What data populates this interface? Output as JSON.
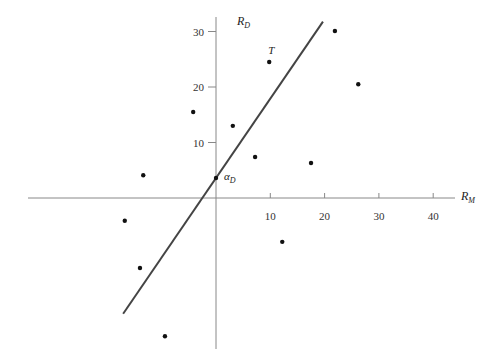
{
  "chart_data": {
    "type": "scatter",
    "title": "",
    "xlabel": "R_M",
    "ylabel": "R_D",
    "xlabel_main": "R",
    "xlabel_sub": "M",
    "ylabel_main": "R",
    "ylabel_sub": "D",
    "xlim": [
      -35,
      44
    ],
    "ylim": [
      -27,
      34
    ],
    "x_ticks": [
      10,
      20,
      30,
      40
    ],
    "y_ticks": [
      10,
      20,
      30
    ],
    "x_tick_labels": [
      "10",
      "20",
      "30",
      "40"
    ],
    "y_tick_labels": [
      "10",
      "20",
      "30"
    ],
    "grid": false,
    "legend": null,
    "series": [
      {
        "name": "observations",
        "points": [
          {
            "x": -13.4,
            "y": 4.1
          },
          {
            "x": -16.8,
            "y": -4.1
          },
          {
            "x": -14.0,
            "y": -12.6
          },
          {
            "x": -9.4,
            "y": -24.9
          },
          {
            "x": -4.2,
            "y": 15.5
          },
          {
            "x": 3.1,
            "y": 13.0
          },
          {
            "x": 7.2,
            "y": 7.4
          },
          {
            "x": 9.8,
            "y": 24.5,
            "label": "T"
          },
          {
            "x": 17.5,
            "y": 6.3
          },
          {
            "x": 12.2,
            "y": -7.9
          },
          {
            "x": 21.9,
            "y": 30.1
          },
          {
            "x": 26.2,
            "y": 20.5
          }
        ]
      }
    ],
    "regression_line": {
      "intercept": 3.6,
      "slope": 1.43,
      "x_start": -17.1,
      "x_end": 19.7,
      "intercept_label": "α_D",
      "intercept_label_main": "α",
      "intercept_label_sub": "D"
    },
    "annotations": [
      {
        "text": "T",
        "x": 9.8,
        "y": 24.5
      },
      {
        "text": "α_D",
        "x": 0,
        "y": 3.6
      }
    ]
  }
}
